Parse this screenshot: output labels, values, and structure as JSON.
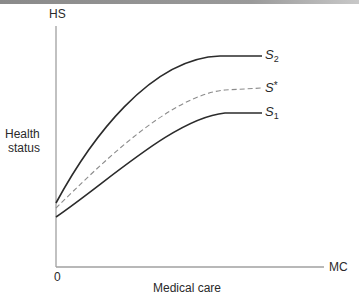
{
  "axes": {
    "y_label_short": "HS",
    "y_label_line1": "Health",
    "y_label_line2": "status",
    "x_label_short": "MC",
    "x_label": "Medical care",
    "origin": "0"
  },
  "curves": [
    {
      "id": "S2",
      "letter": "S",
      "sub": "2",
      "sup": "",
      "style": "solid"
    },
    {
      "id": "Sstar",
      "letter": "S",
      "sub": "",
      "sup": "*",
      "style": "dashed"
    },
    {
      "id": "S1",
      "letter": "S",
      "sub": "1",
      "sup": "",
      "style": "solid"
    }
  ],
  "colors": {
    "axis": "#9a9a9a",
    "curve": "#2b2b2b",
    "dashed": "#8c8c8c"
  }
}
